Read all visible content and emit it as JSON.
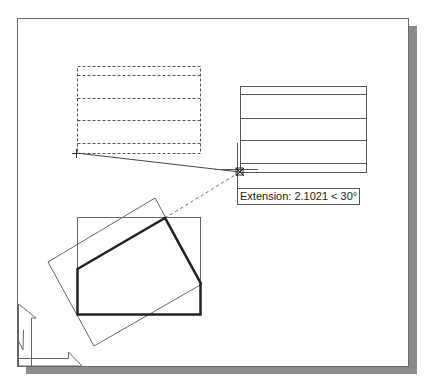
{
  "page": {
    "cut_off_caption": "...y ... p..."
  },
  "drawing": {
    "tooltip": {
      "label": "Extension: 2.1021 < 30°",
      "extension_value": "2.1021",
      "angle": "30°"
    },
    "colors": {
      "background": "#ffffff",
      "frame_border": "#6a6a6a",
      "shadow": "#8a8a8a",
      "thin_line": "#555555",
      "thick_line": "#222222"
    },
    "objects": [
      "dashed-rectangle-with-rows",
      "solid-rectangle-with-rows",
      "rotated-rectangle",
      "axis-aligned-rectangle",
      "thick-pentagon-polyline",
      "rubber-band-line",
      "extension-tracking-line",
      "crosshair-cursor",
      "ucs-icon"
    ]
  }
}
